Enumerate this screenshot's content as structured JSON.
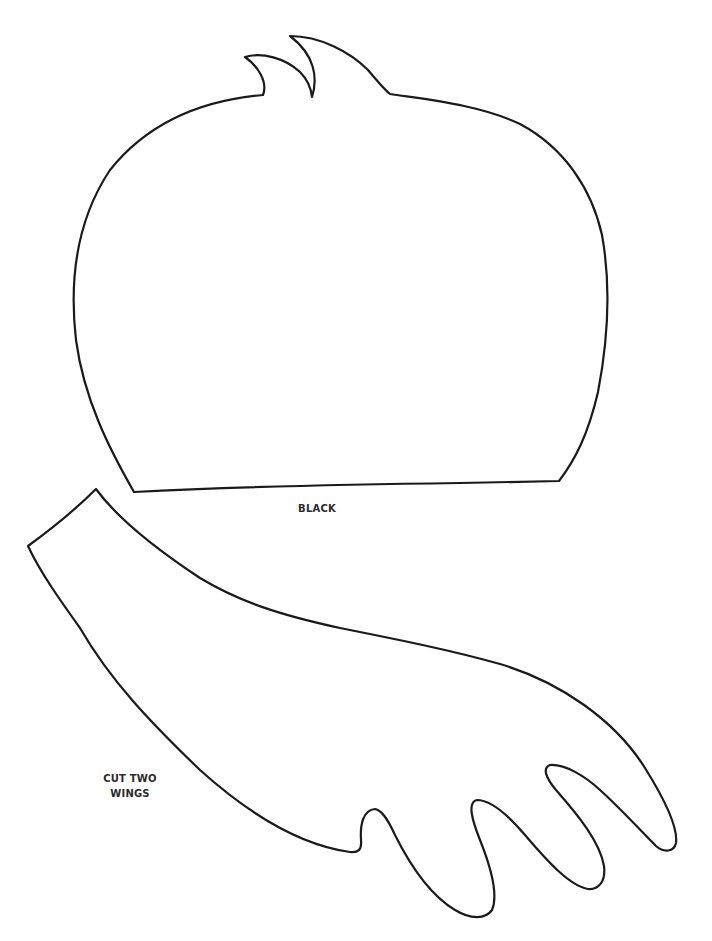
{
  "document": {
    "type": "craft-template",
    "pieces": [
      {
        "id": "body",
        "name": "Body / head piece",
        "label": "BLACK",
        "outline_color": "#1a1a1a"
      },
      {
        "id": "wing",
        "name": "Wing piece",
        "label_lines": [
          "CUT TWO",
          "WINGS"
        ],
        "outline_color": "#1a1a1a"
      }
    ]
  },
  "labels": {
    "body_color": "BLACK",
    "wing_line1": "CUT TWO",
    "wing_line2": "WINGS"
  },
  "colors": {
    "background": "#ffffff",
    "stroke": "#1a1a1a",
    "text": "#2a2a2a"
  }
}
